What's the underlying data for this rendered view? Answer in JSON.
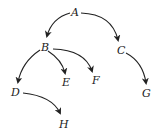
{
  "diagram": {
    "type": "tree",
    "nodes": [
      {
        "id": "A",
        "label": "A",
        "x": 75,
        "y": 15
      },
      {
        "id": "B",
        "label": "B",
        "x": 45,
        "y": 50
      },
      {
        "id": "C",
        "label": "C",
        "x": 121,
        "y": 53
      },
      {
        "id": "D",
        "label": "D",
        "x": 15,
        "y": 96
      },
      {
        "id": "E",
        "label": "E",
        "x": 66,
        "y": 86
      },
      {
        "id": "F",
        "label": "F",
        "x": 96,
        "y": 84
      },
      {
        "id": "G",
        "label": "G",
        "x": 146,
        "y": 97
      },
      {
        "id": "H",
        "label": "H",
        "x": 64,
        "y": 128
      }
    ],
    "edges": [
      {
        "from": "A",
        "to": "B"
      },
      {
        "from": "A",
        "to": "C"
      },
      {
        "from": "B",
        "to": "D"
      },
      {
        "from": "B",
        "to": "E"
      },
      {
        "from": "B",
        "to": "F"
      },
      {
        "from": "C",
        "to": "G"
      },
      {
        "from": "D",
        "to": "H"
      }
    ]
  }
}
